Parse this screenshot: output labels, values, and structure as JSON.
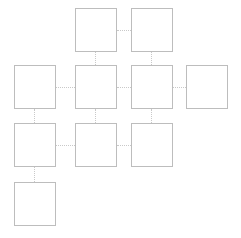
{
  "diagram": {
    "background_color": "#ffffff",
    "node_border_color": "#bdbdbd",
    "connector_color": "#c9c9c9",
    "node_width": 42,
    "node_height": 44,
    "column_count": 4,
    "row_count": 4,
    "column_x": [
      14,
      75,
      131,
      186
    ],
    "row_y": [
      8,
      65,
      123,
      182
    ],
    "nodes": [
      {
        "id": "r1c2",
        "label": "",
        "row": 1,
        "column": 2,
        "x": 75,
        "y": 8
      },
      {
        "id": "r1c3",
        "label": "",
        "row": 1,
        "column": 3,
        "x": 131,
        "y": 8
      },
      {
        "id": "r2c1",
        "label": "",
        "row": 2,
        "column": 1,
        "x": 14,
        "y": 65
      },
      {
        "id": "r2c2",
        "label": "",
        "row": 2,
        "column": 2,
        "x": 75,
        "y": 65
      },
      {
        "id": "r2c3",
        "label": "",
        "row": 2,
        "column": 3,
        "x": 131,
        "y": 65
      },
      {
        "id": "r2c4",
        "label": "",
        "row": 2,
        "column": 4,
        "x": 186,
        "y": 65
      },
      {
        "id": "r3c1",
        "label": "",
        "row": 3,
        "column": 1,
        "x": 14,
        "y": 123
      },
      {
        "id": "r3c2",
        "label": "",
        "row": 3,
        "column": 2,
        "x": 75,
        "y": 123
      },
      {
        "id": "r3c3",
        "label": "",
        "row": 3,
        "column": 3,
        "x": 131,
        "y": 123
      },
      {
        "id": "r4c1",
        "label": "",
        "row": 4,
        "column": 1,
        "x": 14,
        "y": 182
      }
    ],
    "connectors": [
      {
        "id": "r1c2-r1c3",
        "orientation": "horizontal",
        "from": "r1c2",
        "to": "r1c3",
        "x": 117,
        "y": 30,
        "length": 14
      },
      {
        "id": "r2c1-r2c2",
        "orientation": "horizontal",
        "from": "r2c1",
        "to": "r2c2",
        "x": 56,
        "y": 87,
        "length": 19
      },
      {
        "id": "r2c2-r2c3",
        "orientation": "horizontal",
        "from": "r2c2",
        "to": "r2c3",
        "x": 117,
        "y": 87,
        "length": 14
      },
      {
        "id": "r2c3-r2c4",
        "orientation": "horizontal",
        "from": "r2c3",
        "to": "r2c4",
        "x": 173,
        "y": 87,
        "length": 13
      },
      {
        "id": "r3c1-r3c2",
        "orientation": "horizontal",
        "from": "r3c1",
        "to": "r3c2",
        "x": 56,
        "y": 145,
        "length": 19
      },
      {
        "id": "r3c2-r3c3",
        "orientation": "horizontal",
        "from": "r3c2",
        "to": "r3c3",
        "x": 117,
        "y": 145,
        "length": 14
      },
      {
        "id": "r1c2-r2c2",
        "orientation": "vertical",
        "from": "r1c2",
        "to": "r2c2",
        "x": 95,
        "y": 52,
        "length": 13
      },
      {
        "id": "r1c3-r2c3",
        "orientation": "vertical",
        "from": "r1c3",
        "to": "r2c3",
        "x": 151,
        "y": 52,
        "length": 13
      },
      {
        "id": "r2c1-r3c1",
        "orientation": "vertical",
        "from": "r2c1",
        "to": "r3c1",
        "x": 34,
        "y": 109,
        "length": 14
      },
      {
        "id": "r2c2-r3c2",
        "orientation": "vertical",
        "from": "r2c2",
        "to": "r3c2",
        "x": 95,
        "y": 109,
        "length": 14
      },
      {
        "id": "r2c3-r3c3",
        "orientation": "vertical",
        "from": "r2c3",
        "to": "r3c3",
        "x": 151,
        "y": 109,
        "length": 14
      },
      {
        "id": "r3c1-r4c1",
        "orientation": "vertical",
        "from": "r3c1",
        "to": "r4c1",
        "x": 34,
        "y": 167,
        "length": 15
      }
    ]
  }
}
